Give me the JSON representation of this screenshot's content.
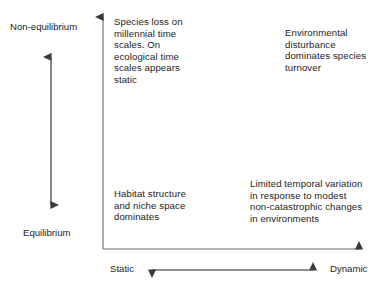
{
  "diagram": {
    "background_color": "#ffffff",
    "line_color": "#555555",
    "text_color": "#1d1d1d",
    "axes": {
      "vertical": {
        "name": "equilibrium-axis",
        "top_label": "Non-equilibrium",
        "bottom_label": "Equilibrium",
        "arrow_style": "double-headed"
      },
      "horizontal": {
        "name": "dynamism-axis",
        "left_label": "Static",
        "right_label": "Dynamic",
        "arrow_style": "double-headed"
      }
    },
    "quadrants": [
      {
        "id": "top-left",
        "position": "non-equilibrium / static",
        "text": "Species loss on millennial time scales. On ecological time scales appears static"
      },
      {
        "id": "top-right",
        "position": "non-equilibrium / dynamic",
        "text": "Environmental disturbance dominates species turnover"
      },
      {
        "id": "bottom-left",
        "position": "equilibrium / static",
        "text": "Habitat structure and niche space dominates"
      },
      {
        "id": "bottom-right",
        "position": "equilibrium / dynamic",
        "text": "Limited temporal variation in response to modest non-catastrophic changes in environments"
      }
    ]
  }
}
